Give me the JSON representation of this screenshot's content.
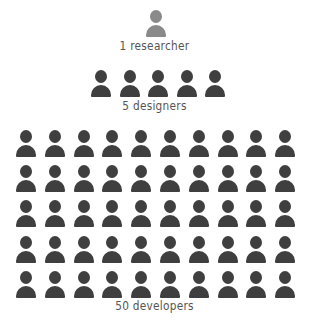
{
  "groups": [
    {
      "role": "researcher",
      "count": 1,
      "label": "1 researcher",
      "color": "#8a8a8a",
      "per_row": 1
    },
    {
      "role": "designer",
      "count": 5,
      "label": "5 designers",
      "color": "#3f3f3f",
      "per_row": 5
    },
    {
      "role": "developer",
      "count": 50,
      "label": "50 developers",
      "color": "#3f3f3f",
      "per_row": 10
    }
  ],
  "icon": "person-icon"
}
